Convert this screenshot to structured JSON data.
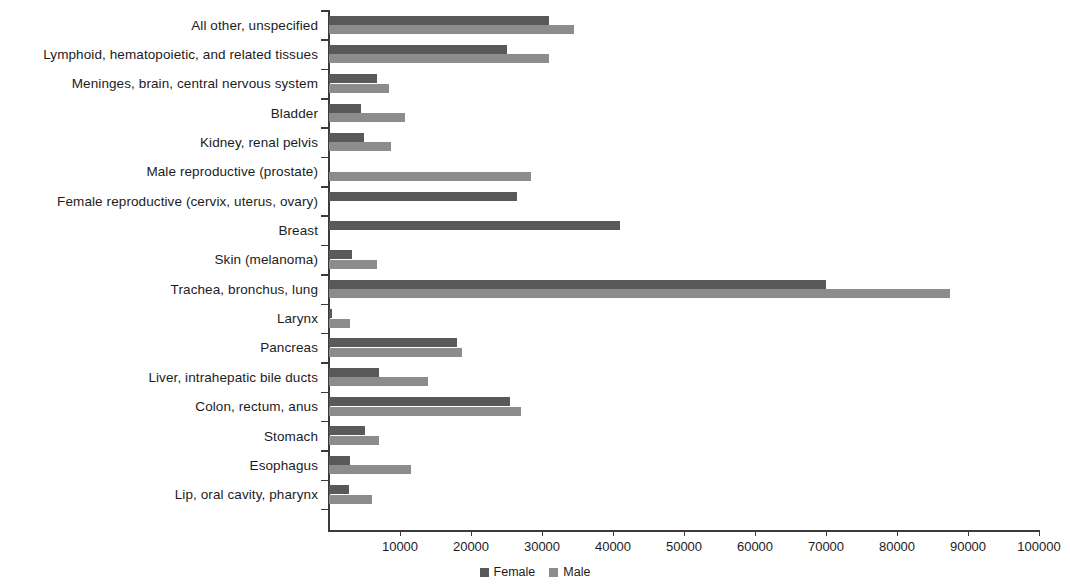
{
  "chart_data": {
    "type": "bar",
    "orientation": "horizontal",
    "title": "",
    "subtitle": "",
    "xlabel": "",
    "ylabel": "",
    "xlim": [
      0,
      100000
    ],
    "grid": false,
    "legend_position": "bottom-center",
    "xticks": [
      10000,
      20000,
      30000,
      40000,
      50000,
      60000,
      70000,
      80000,
      90000,
      100000
    ],
    "xtick_labels": [
      "10000",
      "20000",
      "30000",
      "40000",
      "50000",
      "60000",
      "70000",
      "80000",
      "90000",
      "100000"
    ],
    "categories": [
      "All other, unspecified",
      "Lymphoid, hematopoietic, and related tissues",
      "Meninges, brain, central nervous system",
      "Bladder",
      "Kidney, renal pelvis",
      "Male reproductive (prostate)",
      "Female reproductive (cervix, uterus, ovary)",
      "Breast",
      "Skin (melanoma)",
      "Trachea, bronchus, lung",
      "Larynx",
      "Pancreas",
      "Liver, intrahepatic bile ducts",
      "Colon, rectum, anus",
      "Stomach",
      "Esophagus",
      "Lip, oral cavity, pharynx"
    ],
    "series": [
      {
        "name": "Female",
        "color": "#595959",
        "values": [
          31000,
          25000,
          6800,
          4500,
          4900,
          0,
          26500,
          41000,
          3300,
          70000,
          400,
          18000,
          7000,
          25500,
          5000,
          3000,
          2800
        ]
      },
      {
        "name": "Male",
        "color": "#8c8c8c",
        "values": [
          34500,
          31000,
          8400,
          10700,
          8700,
          28500,
          0,
          0,
          6700,
          87500,
          3000,
          18700,
          14000,
          27000,
          7000,
          11500,
          6000
        ]
      }
    ]
  },
  "legend": {
    "items": [
      {
        "label": "Female",
        "color": "#595959"
      },
      {
        "label": "Male",
        "color": "#8c8c8c"
      }
    ]
  },
  "colors": {
    "female": "#595959",
    "male": "#8c8c8c",
    "axis": "#3a3a3a",
    "text": "#1c1c1c",
    "background": "#ffffff"
  }
}
